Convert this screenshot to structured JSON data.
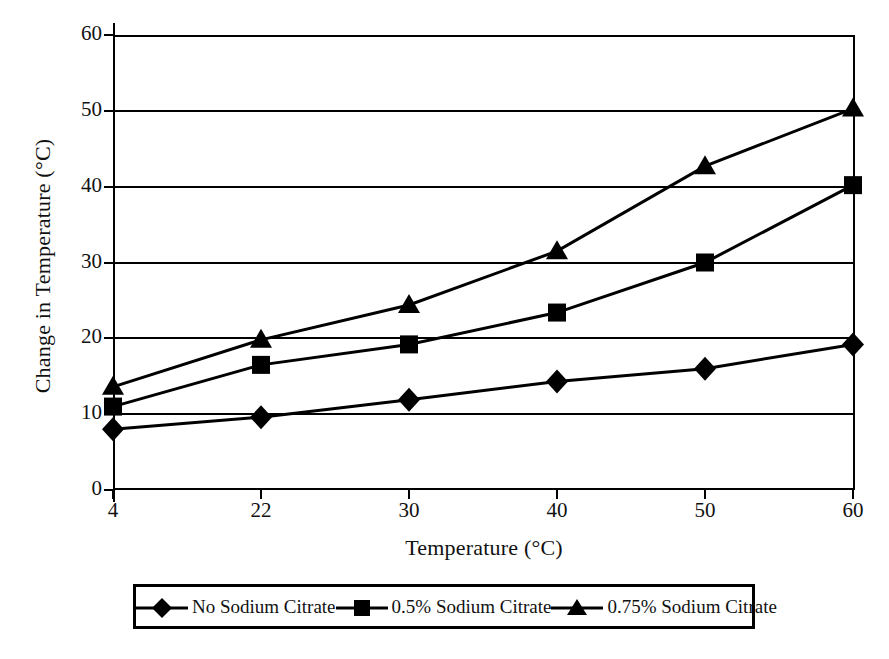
{
  "chart_data": {
    "type": "line",
    "title": "",
    "xlabel": "Temperature (°C)",
    "ylabel": "Change in Temperature (°C)",
    "categories": [
      "4",
      "22",
      "30",
      "40",
      "50",
      "60"
    ],
    "ylim": [
      0,
      60
    ],
    "yticks": [
      "0",
      "10",
      "20",
      "30",
      "40",
      "50",
      "60"
    ],
    "grid": "horizontal",
    "legend_position": "bottom",
    "series": [
      {
        "name": "No Sodium Citrate",
        "marker": "diamond",
        "color": "#000000",
        "values": [
          8,
          9.6,
          11.9,
          14.3,
          16,
          19.2
        ]
      },
      {
        "name": "0.5% Sodium Citrate",
        "marker": "square",
        "color": "#000000",
        "values": [
          11,
          16.5,
          19.2,
          23.4,
          30,
          40.2
        ]
      },
      {
        "name": "0.75% Sodium Citrate",
        "marker": "triangle",
        "color": "#000000",
        "values": [
          13.6,
          19.8,
          24.4,
          31.5,
          42.7,
          50.3
        ]
      }
    ]
  },
  "axes": {
    "y_title": "Change in Temperature (°C)",
    "x_title": "Temperature (°C)",
    "y_tick_labels": [
      "60",
      "50",
      "40",
      "30",
      "20",
      "10",
      "0"
    ],
    "x_tick_labels": [
      "4",
      "22",
      "30",
      "40",
      "50",
      "60"
    ]
  },
  "legend": {
    "items": [
      {
        "label": "No Sodium Citrate",
        "marker": "diamond"
      },
      {
        "label": "0.5% Sodium Citrate",
        "marker": "square"
      },
      {
        "label": "0.75% Sodium Citrate",
        "marker": "triangle"
      }
    ]
  }
}
